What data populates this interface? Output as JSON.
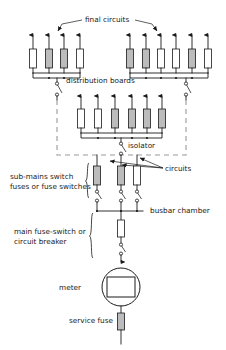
{
  "diagram": {
    "labels": {
      "final_circuits": "final circuits",
      "distribution_boards": "distribution boards",
      "isolator": "isolator",
      "circuits": "circuits",
      "sub_mains_line1": "sub-mains switch",
      "sub_mains_line2": "fuses or fuse switches",
      "busbar_chamber": "busbar chamber",
      "main_line1": "main fuse-switch or",
      "main_line2": "circuit breaker",
      "meter": "meter",
      "service_fuse": "service fuse"
    },
    "colors": {
      "line": "#1a1a1a",
      "dashed_enclosure": "#9a9a9a",
      "fuse_fill_light": "#ffffff",
      "fuse_fill_dark": "#bcbcbc",
      "background": "#ffffff"
    },
    "boards": [
      {
        "name": "left-distribution-board",
        "fuse_count": 4,
        "fuse_shades": [
          "light",
          "dark",
          "dark",
          "light"
        ]
      },
      {
        "name": "right-distribution-board",
        "fuse_count": 6,
        "fuse_shades": [
          "dark",
          "dark",
          "light",
          "light",
          "dark",
          "light"
        ]
      },
      {
        "name": "middle-distribution-board",
        "fuse_count": 6,
        "fuse_shades": [
          "light",
          "light",
          "dark",
          "dark",
          "dark",
          "dark"
        ]
      }
    ],
    "sub_mains": {
      "name": "sub-mains-switch-fuses",
      "branch_count": 3,
      "fuse_shades": [
        "dark",
        "dark",
        "light"
      ]
    },
    "counts": {
      "final_circuit_arrows_left": 4,
      "final_circuit_arrows_right": 6,
      "final_circuit_arrows_middle": 6,
      "circuits_pointers": 3
    }
  }
}
